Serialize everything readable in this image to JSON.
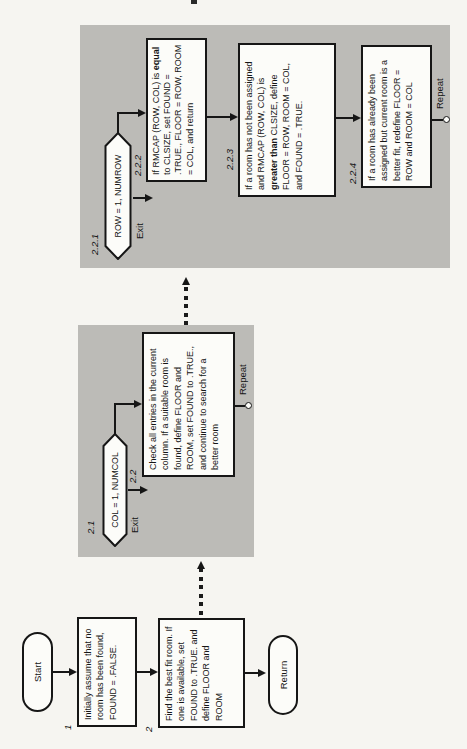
{
  "colors": {
    "page_bg": "#f6f5f1",
    "panel_gray": "#bcbbb7",
    "ink": "#161616"
  },
  "main_flow": {
    "start_label": "Start",
    "return_label": "Return",
    "box1": {
      "number": "1",
      "text": "Initially assume that no room has been found, FOUND = .FALSE."
    },
    "box2": {
      "number": "2",
      "text": "Find the best fit room. If one is available, set FOUND to .TRUE. and define FLOOR and ROOM"
    }
  },
  "panel21": {
    "loop": {
      "number": "2.1",
      "text": "COL = 1, NUMCOL"
    },
    "exit_label": "Exit",
    "repeat_label": "Repeat",
    "box22": {
      "number": "2.2",
      "text": "Check all entries in the current column. If a suitable room is found, define FLOOR and ROOM, set FOUND to .TRUE., and continue to search for a better room"
    }
  },
  "panel221": {
    "loop": {
      "number": "2.2.1",
      "text": "ROW = 1, NUMROW"
    },
    "exit_label": "Exit",
    "repeat_label": "Repeat",
    "box222": {
      "number": "2.2.2",
      "t1": "If RMCAP (ROW, COL) is ",
      "bold": "equal",
      "t2": " to CLSIZE, set FOUND = .TRUE., FLOOR = ROW, ROOM = COL, and return"
    },
    "box223": {
      "number": "2.2.3",
      "t1": "If a room has not been assigned and RMCAP (ROW, COL) is ",
      "bold": "greater than",
      "t2": " CLSIZE, define FLOOR = ROW, ROOM = COL, and FOUND = .TRUE."
    },
    "box224": {
      "number": "2.2.4",
      "text": "If a room has already been assigned but current room is a better fit, redefine FLOOR = ROW and ROOM = COL"
    }
  }
}
